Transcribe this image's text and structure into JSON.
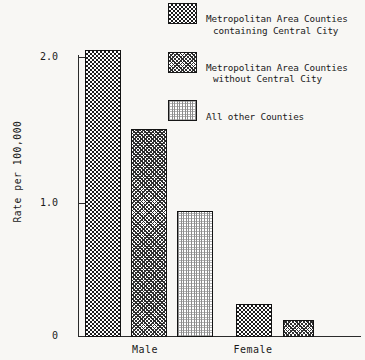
{
  "chart_data": {
    "type": "bar",
    "title": "",
    "subtitle": "",
    "xlabel": "",
    "ylabel": "Rate per 100,000",
    "categories": [
      "Male",
      "Female"
    ],
    "series": [
      {
        "name": "Metropolitan Area Counties containing Central City",
        "pattern": "dark-checkerboard",
        "values": [
          2.06,
          0.24
        ]
      },
      {
        "name": "Metropolitan Area Counties without Central City",
        "pattern": "diagonal-crosshatch",
        "values": [
          1.49,
          0.12
        ]
      },
      {
        "name": "All other Counties",
        "pattern": "light-stipple",
        "values": [
          0.9,
          null
        ]
      }
    ],
    "ylim": [
      0,
      2.2
    ],
    "yticks": [
      0,
      1.0,
      2.0
    ],
    "ytick_labels": [
      "0",
      "1.0",
      "2.0"
    ],
    "grid": false,
    "legend_position": "top-right"
  },
  "axes": {
    "y_title": "Rate per 100,000",
    "y_ticks": [
      {
        "label": "2.0",
        "value": 2.0
      },
      {
        "label": "1.0",
        "value": 1.0
      },
      {
        "label": "0",
        "value": 0
      }
    ],
    "x_groups": [
      {
        "label": "Male"
      },
      {
        "label": "Female"
      }
    ]
  },
  "legend": {
    "items": [
      {
        "line1": "Metropolitan Area Counties",
        "line2": "containing Central City",
        "swatch": "dark-checkerboard-swatch"
      },
      {
        "line1": "Metropolitan Area Counties",
        "line2": "without Central City",
        "swatch": "diagonal-crosshatch-swatch"
      },
      {
        "line1": "All other Counties",
        "line2": "",
        "swatch": "light-stipple-swatch"
      }
    ]
  },
  "colors": {
    "background": "#f8f7f4",
    "axis": "#2b2b2b",
    "ink": "#1a1a1a",
    "series_dark": "#1c1c1c",
    "series_mid": "#2a2a2a",
    "series_light": "#8d8d8d"
  }
}
